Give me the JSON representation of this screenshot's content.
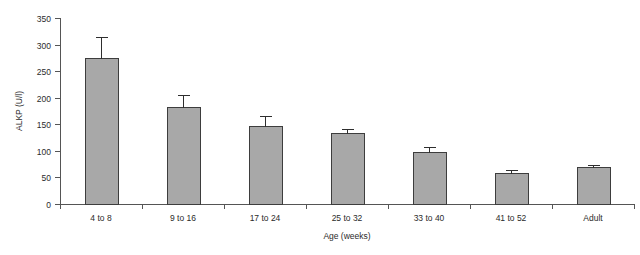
{
  "chart_data": {
    "type": "bar",
    "title": "",
    "subtitle": "",
    "xlabel": "Age (weeks)",
    "ylabel": "ALKP (U/l)",
    "categories": [
      "4 to 8",
      "9 to 16",
      "17 to 24",
      "25 to 32",
      "33 to 40",
      "41 to 52",
      "Adult"
    ],
    "values": [
      275,
      183,
      147,
      134,
      97,
      59,
      69
    ],
    "errors": [
      39,
      22,
      18,
      8,
      11,
      5,
      5
    ],
    "error_type": "upper-whisker",
    "ylim": [
      0,
      350
    ],
    "yticks": [
      0,
      50,
      100,
      150,
      200,
      250,
      300,
      350
    ],
    "ytick_labels": [
      "0",
      "50",
      "100",
      "150",
      "200",
      "250",
      "300",
      "350"
    ],
    "grid": false,
    "legend": "none",
    "bar_color": "#a8a8a8",
    "bar_edge_color": "#3d3d3d",
    "axis_color": "#555555",
    "series": [
      {
        "name": "ALKP",
        "values": [
          275,
          183,
          147,
          134,
          97,
          59,
          69
        ],
        "errors": [
          39,
          22,
          18,
          8,
          11,
          5,
          5
        ]
      }
    ]
  }
}
